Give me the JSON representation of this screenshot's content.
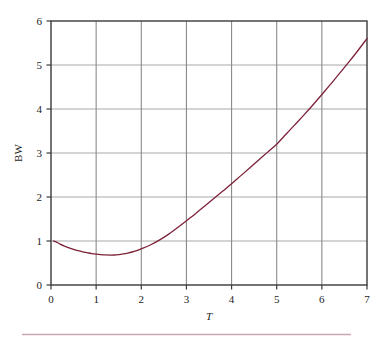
{
  "chart_data": {
    "type": "line",
    "title": "",
    "xlabel": "T",
    "ylabel": "BW",
    "xlim": [
      0,
      7
    ],
    "ylim": [
      0,
      6
    ],
    "xticks": [
      "0",
      "1",
      "2",
      "3",
      "4",
      "5",
      "6",
      "7"
    ],
    "yticks": [
      "0",
      "1",
      "2",
      "3",
      "4",
      "5",
      "6"
    ],
    "xtick_values": [
      0,
      1,
      2,
      3,
      4,
      5,
      6,
      7
    ],
    "ytick_values": [
      0,
      1,
      2,
      3,
      4,
      5,
      6
    ],
    "grid": true,
    "grid_color": "#9a9a9a",
    "legend": null,
    "series": [
      {
        "name": "BW(T)",
        "color": "#7d2239",
        "linewidth": 1.3,
        "x": [
          0.05,
          0.1,
          0.2,
          0.3,
          0.4,
          0.5,
          0.6,
          0.7,
          0.8,
          0.9,
          1.0,
          1.1,
          1.2,
          1.3,
          1.4,
          1.5,
          1.6,
          1.7,
          1.8,
          1.9,
          2.0,
          2.2,
          2.4,
          2.6,
          2.8,
          3.0,
          3.2,
          3.4,
          3.6,
          3.8,
          4.0,
          4.2,
          4.4,
          4.6,
          4.8,
          5.0,
          5.2,
          5.4,
          5.6,
          5.8,
          6.0,
          6.2,
          6.4,
          6.6,
          6.8,
          7.0
        ],
        "y": [
          1.0,
          0.985,
          0.93,
          0.885,
          0.845,
          0.81,
          0.78,
          0.755,
          0.735,
          0.715,
          0.7,
          0.69,
          0.683,
          0.68,
          0.682,
          0.69,
          0.705,
          0.725,
          0.75,
          0.78,
          0.82,
          0.91,
          1.02,
          1.15,
          1.3,
          1.46,
          1.62,
          1.79,
          1.96,
          2.13,
          2.3,
          2.48,
          2.66,
          2.84,
          3.02,
          3.2,
          3.42,
          3.64,
          3.86,
          4.09,
          4.33,
          4.57,
          4.82,
          5.07,
          5.33,
          5.6
        ]
      }
    ],
    "annotations": [],
    "footer_rule": {
      "color": "#c8a8b0",
      "present": true
    }
  },
  "figure": {
    "background": "#ffffff",
    "frame_color": "#3a3a3a",
    "axis_label_y": "BW",
    "axis_label_x": "T"
  }
}
